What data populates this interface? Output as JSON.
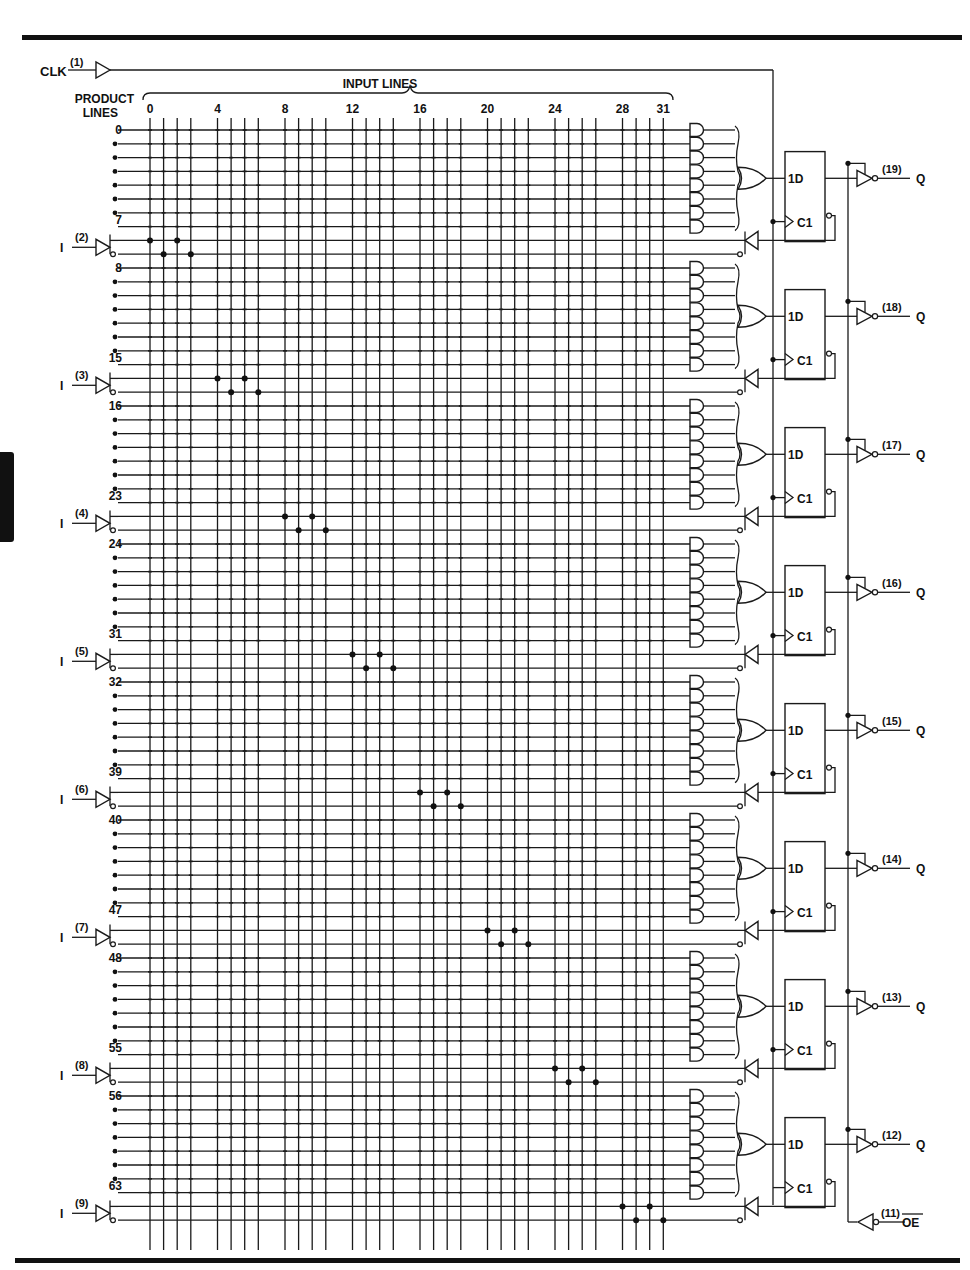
{
  "figure": {
    "type": "logic-diagram",
    "device": "registered PAL (8 registered outputs, 32 input lines, 64 product lines)"
  },
  "clock": {
    "label": "CLK",
    "pin": "(1)"
  },
  "headers": {
    "input_lines": "INPUT LINES",
    "product_lines_1": "PRODUCT",
    "product_lines_2": "LINES"
  },
  "input_line_ticks": [
    {
      "col": 0,
      "label": "0"
    },
    {
      "col": 4,
      "label": "4"
    },
    {
      "col": 8,
      "label": "8"
    },
    {
      "col": 12,
      "label": "12"
    },
    {
      "col": 16,
      "label": "16"
    },
    {
      "col": 20,
      "label": "20"
    },
    {
      "col": 24,
      "label": "24"
    },
    {
      "col": 28,
      "label": "28"
    },
    {
      "col": 31,
      "label": "31"
    }
  ],
  "blocks": [
    {
      "first": "0",
      "last": "7",
      "input_label": "I",
      "input_pin": "(2)",
      "output_pin": "(19)",
      "output_label": "Q"
    },
    {
      "first": "8",
      "last": "15",
      "input_label": "I",
      "input_pin": "(3)",
      "output_pin": "(18)",
      "output_label": "Q"
    },
    {
      "first": "16",
      "last": "23",
      "input_label": "I",
      "input_pin": "(4)",
      "output_pin": "(17)",
      "output_label": "Q"
    },
    {
      "first": "24",
      "last": "31",
      "input_label": "I",
      "input_pin": "(5)",
      "output_pin": "(16)",
      "output_label": "Q"
    },
    {
      "first": "32",
      "last": "39",
      "input_label": "I",
      "input_pin": "(6)",
      "output_pin": "(15)",
      "output_label": "Q"
    },
    {
      "first": "40",
      "last": "47",
      "input_label": "I",
      "input_pin": "(7)",
      "output_pin": "(14)",
      "output_label": "Q"
    },
    {
      "first": "48",
      "last": "55",
      "input_label": "I",
      "input_pin": "(8)",
      "output_pin": "(13)",
      "output_label": "Q"
    },
    {
      "first": "56",
      "last": "63",
      "input_label": "I",
      "input_pin": "(9)",
      "output_pin": "(12)",
      "output_label": "Q"
    }
  ],
  "flipflop": {
    "d_label": "1D",
    "c_label": "C1"
  },
  "output_enable": {
    "pin": "(11)",
    "label": "OE"
  },
  "colors": {
    "ink": "#111111",
    "paper": "#ffffff"
  }
}
